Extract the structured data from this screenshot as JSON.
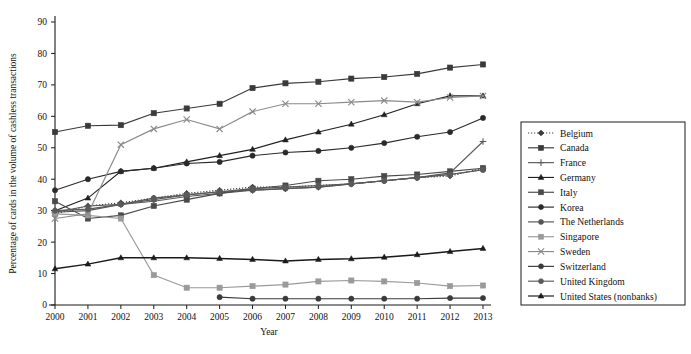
{
  "chart_data": {
    "type": "line",
    "title": "",
    "xlabel": "Year",
    "ylabel": "Percentage of cards in the volume of cashless transactions",
    "x": [
      2000,
      2001,
      2002,
      2003,
      2004,
      2005,
      2006,
      2007,
      2008,
      2009,
      2010,
      2011,
      2012,
      2013
    ],
    "xlim": [
      2000,
      2013
    ],
    "ylim": [
      0,
      90
    ],
    "yticks": [
      0,
      10,
      20,
      30,
      40,
      50,
      60,
      70,
      80,
      90
    ],
    "xticks": [
      "2000",
      "2001",
      "2002",
      "2003",
      "2004",
      "2005",
      "2006",
      "2007",
      "2008",
      "2009",
      "2010",
      "2011",
      "2012",
      "2013"
    ],
    "grid": false,
    "legend_position": "right",
    "series": [
      {
        "name": "Belgium",
        "marker": "diamond",
        "dash": "1.2,1.8",
        "color": "#3c3c3c",
        "values": [
          29.0,
          31.5,
          32.5,
          34.0,
          35.5,
          36.5,
          37.5,
          37.5,
          38.0,
          38.5,
          39.5,
          40.5,
          41.0,
          43.5
        ]
      },
      {
        "name": "Canada",
        "marker": "square",
        "dash": "",
        "color": "#3a3a3a",
        "values": [
          55.0,
          57.0,
          57.2,
          61.0,
          62.5,
          64.0,
          69.0,
          70.5,
          71.0,
          72.0,
          72.5,
          73.5,
          75.5,
          76.5
        ]
      },
      {
        "name": "France",
        "marker": "plus",
        "dash": "",
        "color": "#5a5a5a",
        "values": [
          29.5,
          31.5,
          32.0,
          33.0,
          34.5,
          35.5,
          36.5,
          37.0,
          37.5,
          38.5,
          39.5,
          40.5,
          42.0,
          52.0
        ]
      },
      {
        "name": "Germany",
        "marker": "triangle",
        "dash": "",
        "color": "#202020",
        "values": [
          30.0,
          34.0,
          42.5,
          43.5,
          45.5,
          47.5,
          49.5,
          52.5,
          55.0,
          57.5,
          60.5,
          64.0,
          66.5,
          66.5
        ]
      },
      {
        "name": "Italy",
        "marker": "square",
        "dash": "",
        "color": "#4a4a4a",
        "values": [
          33.0,
          27.5,
          28.5,
          31.5,
          33.5,
          35.5,
          37.0,
          38.0,
          39.5,
          40.0,
          41.0,
          41.5,
          42.5,
          43.5
        ]
      },
      {
        "name": "Korea",
        "marker": "circle",
        "dash": "",
        "color": "#2a2a2a",
        "values": [
          36.5,
          40.0,
          42.5,
          43.5,
          45.0,
          45.5,
          47.5,
          48.5,
          49.0,
          50.0,
          51.5,
          53.5,
          55.0,
          59.5
        ]
      },
      {
        "name": "The Netherlands",
        "marker": "circle",
        "dash": "",
        "color": "#555555",
        "values": [
          29.5,
          30.0,
          32.0,
          34.0,
          35.0,
          36.0,
          36.5,
          37.0,
          37.5,
          38.5,
          39.5,
          40.5,
          41.5,
          43.0
        ]
      },
      {
        "name": "Singapore",
        "marker": "square",
        "dash": "",
        "color": "#9a9a9a",
        "values": [
          29.0,
          28.5,
          27.5,
          9.5,
          5.5,
          5.5,
          6.0,
          6.5,
          7.5,
          7.8,
          7.5,
          7.0,
          6.0,
          6.2
        ]
      },
      {
        "name": "Sweden",
        "marker": "x",
        "dash": "",
        "color": "#8a8a8a",
        "values": [
          27.5,
          29.0,
          51.0,
          56.0,
          59.0,
          56.0,
          61.5,
          64.0,
          64.0,
          64.5,
          65.0,
          64.5,
          66.0,
          66.5
        ]
      },
      {
        "name": "Switzerland",
        "marker": "circle",
        "dash": "",
        "color": "#3a3a3a",
        "values": [
          null,
          null,
          null,
          null,
          null,
          2.5,
          2.0,
          2.0,
          2.0,
          2.0,
          2.0,
          2.0,
          2.2,
          2.2
        ]
      },
      {
        "name": "United Kingdom",
        "marker": "circle",
        "dash": "",
        "color": "#5a5a5a",
        "values": [
          30.0,
          30.5,
          32.0,
          33.5,
          35.0,
          36.0,
          37.0,
          37.5,
          38.0,
          38.5,
          39.5,
          40.5,
          41.5,
          43.0
        ]
      },
      {
        "name": "United States (nonbanks)",
        "marker": "triangle",
        "dash": "",
        "color": "#1a1a1a",
        "values": [
          11.5,
          13.0,
          15.0,
          15.0,
          15.0,
          14.8,
          14.5,
          14.0,
          14.5,
          14.7,
          15.2,
          16.0,
          17.0,
          18.0
        ]
      }
    ]
  },
  "legend": {
    "items": [
      {
        "label": "Belgium"
      },
      {
        "label": "Canada"
      },
      {
        "label": "France"
      },
      {
        "label": "Germany"
      },
      {
        "label": "Italy"
      },
      {
        "label": "Korea"
      },
      {
        "label": "The Netherlands"
      },
      {
        "label": "Singapore"
      },
      {
        "label": "Sweden"
      },
      {
        "label": "Switzerland"
      },
      {
        "label": "United Kingdom"
      },
      {
        "label": "United States (nonbanks)"
      }
    ]
  }
}
